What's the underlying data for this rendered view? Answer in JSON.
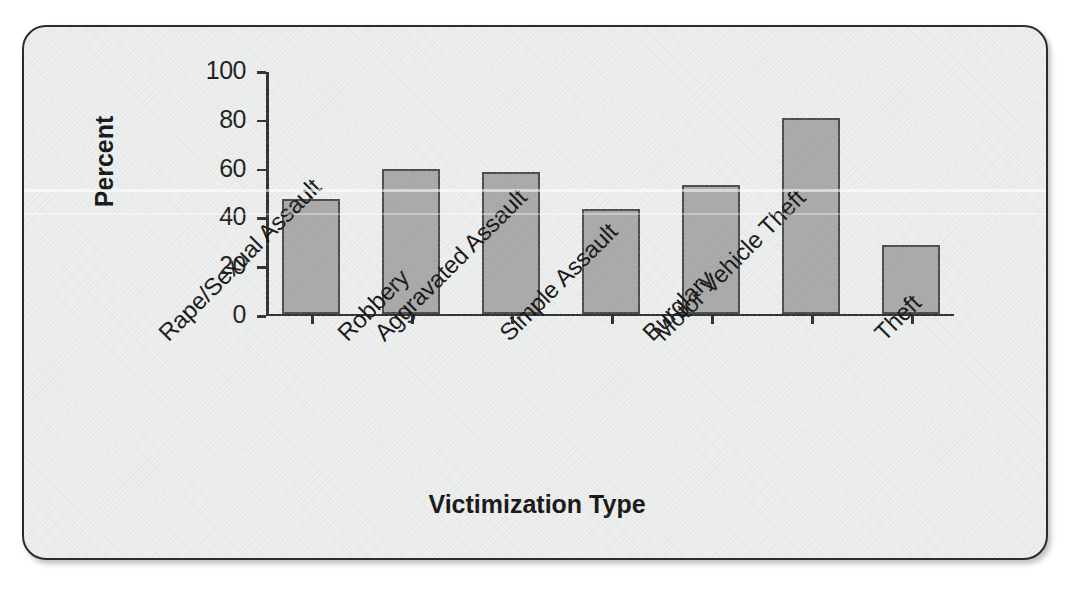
{
  "chart_data": {
    "type": "bar",
    "title": "",
    "subtitle": "",
    "xlabel": "Victimization Type",
    "ylabel": "Percent",
    "categories": [
      "Rape/Sexual Assault",
      "Robbery",
      "Aggravated Assault",
      "Simple Assault",
      "Burglary",
      "Motor Vehicle Theft",
      "Theft"
    ],
    "values": [
      47.5,
      60,
      58.5,
      43.5,
      53.5,
      81,
      28.5
    ],
    "ylim": [
      0,
      100
    ],
    "yticks": [
      0,
      20,
      40,
      60,
      80,
      100
    ],
    "ytick_labels": [
      "0",
      "20",
      "40",
      "60",
      "80",
      "100"
    ],
    "xlim_note": "categorical",
    "grid": false,
    "legend": null,
    "legend_position": "none",
    "bar_color": "#a9a9a9",
    "bar_edge_color": "#4a4a4a",
    "axis_color": "#2e2e2e",
    "background_color": "#eef0ef",
    "frame_border_color": "#2b2b2b",
    "annotations": []
  },
  "figure": {
    "y_axis_title": "Percent",
    "x_axis_title": "Victimization Type"
  }
}
